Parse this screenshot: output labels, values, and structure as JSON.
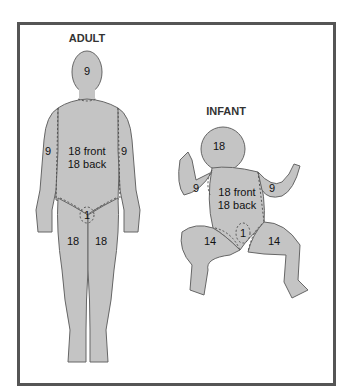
{
  "figure": {
    "adult": {
      "title": "ADULT",
      "regions": {
        "head": "9",
        "left_arm": "9",
        "right_arm": "9",
        "trunk_front": "18 front",
        "trunk_back": "18 back",
        "genitals": "1",
        "left_leg": "18",
        "right_leg": "18"
      }
    },
    "infant": {
      "title": "INFANT",
      "regions": {
        "head": "18",
        "left_arm": "9",
        "right_arm": "9",
        "trunk_front": "18 front",
        "trunk_back": "18 back",
        "genitals": "1",
        "left_leg": "14",
        "right_leg": "14"
      }
    },
    "colors": {
      "body_fill": "#c4c4c4",
      "outline": "#555555",
      "frame": "#555555"
    }
  }
}
